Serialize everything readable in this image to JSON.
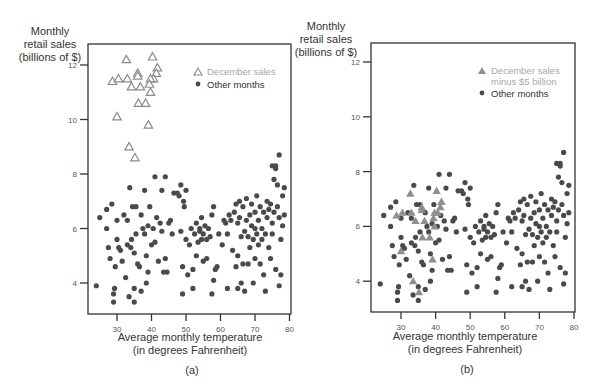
{
  "figure": {
    "panels": [
      {
        "label": "(a)",
        "y_title": [
          "Monthly",
          "retail sales",
          "(billions of $)"
        ],
        "x_title": [
          "Average monthly temperature",
          "(in degrees Fahrenheit)"
        ],
        "legend": [
          {
            "symbol": "open-triangle",
            "label": "December sales"
          },
          {
            "symbol": "dot",
            "label": "Other months"
          }
        ]
      },
      {
        "label": "(b)",
        "y_title": [
          "Monthly",
          "retail sales",
          "(billions of $)"
        ],
        "x_title": [
          "Average monthly temperature",
          "(in degrees Fahrenheit)"
        ],
        "legend": [
          {
            "symbol": "filled-triangle",
            "label": "December sales",
            "label2": "minus $5 billion"
          },
          {
            "symbol": "dot",
            "label": "Other months"
          }
        ]
      }
    ],
    "colors": {
      "dot": "#4a4a4a",
      "triangle_open": "#8a8a8a",
      "triangle_filled": "#8f8f8f",
      "legend_december": "#a8a8a8",
      "axis": "#333333"
    }
  },
  "chart_data": [
    {
      "type": "scatter",
      "title": "(a)",
      "xlabel": "Average monthly temperature (in degrees Fahrenheit)",
      "ylabel": "Monthly retail sales (billions of $)",
      "xlim": [
        22,
        80
      ],
      "ylim": [
        2.9,
        13.2
      ],
      "xticks": [
        30,
        40,
        50,
        60,
        70,
        80
      ],
      "yticks": [
        4,
        6,
        8,
        10,
        12
      ],
      "grid": false,
      "legend_position": "upper right",
      "series": [
        {
          "name": "December sales",
          "marker": "open-triangle",
          "points": [
            [
              32.7,
              12.2
            ],
            [
              40.3,
              12.3
            ],
            [
              36,
              11.7
            ],
            [
              36,
              11.6
            ],
            [
              41.7,
              11.9
            ],
            [
              41.4,
              11.7
            ],
            [
              40.6,
              11.5
            ],
            [
              28.7,
              11.4
            ],
            [
              30.4,
              11.5
            ],
            [
              33,
              11.5
            ],
            [
              34.2,
              11.2
            ],
            [
              36.8,
              11.2
            ],
            [
              39.7,
              11.5
            ],
            [
              39.4,
              11.3
            ],
            [
              39.7,
              11.0
            ],
            [
              36.2,
              10.6
            ],
            [
              38.3,
              10.6
            ],
            [
              30,
              10.1
            ],
            [
              39.1,
              9.8
            ],
            [
              33.5,
              9.0
            ],
            [
              35.2,
              8.6
            ]
          ]
        },
        {
          "name": "Other months",
          "marker": "dot",
          "ref": "other_months"
        }
      ]
    },
    {
      "type": "scatter",
      "title": "(b)",
      "xlabel": "Average monthly temperature (in degrees Fahrenheit)",
      "ylabel": "Monthly retail sales (billions of $)",
      "xlim": [
        22,
        80
      ],
      "ylim": [
        2.9,
        13.2
      ],
      "xticks": [
        30,
        40,
        50,
        60,
        70,
        80
      ],
      "yticks": [
        4,
        6,
        8,
        10,
        12
      ],
      "grid": false,
      "legend_position": "upper right",
      "series": [
        {
          "name": "December sales minus $5 billion",
          "marker": "filled-triangle",
          "points": [
            [
              32.7,
              7.2
            ],
            [
              40.3,
              7.3
            ],
            [
              36,
              6.7
            ],
            [
              36,
              6.6
            ],
            [
              41.7,
              6.9
            ],
            [
              41.4,
              6.7
            ],
            [
              40.6,
              6.5
            ],
            [
              28.7,
              6.4
            ],
            [
              30.4,
              6.5
            ],
            [
              33,
              6.5
            ],
            [
              34.2,
              6.2
            ],
            [
              36.8,
              6.2
            ],
            [
              39.7,
              6.5
            ],
            [
              39.4,
              6.3
            ],
            [
              39.7,
              6.0
            ],
            [
              36.2,
              5.6
            ],
            [
              38.3,
              5.6
            ],
            [
              30,
              5.1
            ],
            [
              39.1,
              4.8
            ],
            [
              33.5,
              4.0
            ],
            [
              35.2,
              3.6
            ]
          ]
        },
        {
          "name": "Other months",
          "marker": "dot",
          "ref": "other_months"
        }
      ]
    }
  ],
  "other_months": [
    [
      24,
      3.9
    ],
    [
      25,
      6.4
    ],
    [
      27,
      6.0
    ],
    [
      27,
      6.7
    ],
    [
      27.5,
      5.3
    ],
    [
      28,
      4.9
    ],
    [
      28.5,
      6.9
    ],
    [
      29,
      3.3
    ],
    [
      29,
      3.6
    ],
    [
      29.3,
      3.8
    ],
    [
      29.5,
      4.6
    ],
    [
      30,
      6.3
    ],
    [
      30,
      5.6
    ],
    [
      30.5,
      5.3
    ],
    [
      31,
      5.2
    ],
    [
      31.5,
      4.8
    ],
    [
      32,
      6.5
    ],
    [
      32.5,
      4.2
    ],
    [
      33,
      6.3
    ],
    [
      33,
      5.4
    ],
    [
      33.5,
      3.5
    ],
    [
      33.7,
      7.5
    ],
    [
      34,
      5.3
    ],
    [
      34.2,
      5.6
    ],
    [
      34.5,
      6.8
    ],
    [
      35,
      3.3
    ],
    [
      35,
      5.1
    ],
    [
      35,
      3.8
    ],
    [
      35.5,
      6.8
    ],
    [
      35.5,
      5.8
    ],
    [
      36,
      4.7
    ],
    [
      36.5,
      4.6
    ],
    [
      37,
      6.5
    ],
    [
      37,
      3.7
    ],
    [
      37.5,
      6.0
    ],
    [
      38,
      5.8
    ],
    [
      38,
      7.4
    ],
    [
      38.5,
      4.0
    ],
    [
      38.5,
      5.0
    ],
    [
      39,
      6.1
    ],
    [
      39,
      4.4
    ],
    [
      39.5,
      6.8
    ],
    [
      40,
      5.4
    ],
    [
      40.5,
      6.0
    ],
    [
      41,
      7.9
    ],
    [
      41,
      5.5
    ],
    [
      41.5,
      6.4
    ],
    [
      42,
      4.8
    ],
    [
      42.5,
      6.2
    ],
    [
      43,
      5.9
    ],
    [
      43,
      7.4
    ],
    [
      43.5,
      4.4
    ],
    [
      44,
      4.9
    ],
    [
      44,
      7.9
    ],
    [
      44.5,
      4.4
    ],
    [
      45,
      6.2
    ],
    [
      45.5,
      6.3
    ],
    [
      46,
      5.8
    ],
    [
      46.5,
      7.3
    ],
    [
      47.5,
      7.3
    ],
    [
      48,
      7.2
    ],
    [
      48.5,
      5.9
    ],
    [
      48.5,
      7.6
    ],
    [
      49,
      3.6
    ],
    [
      49,
      4.6
    ],
    [
      49.3,
      7.0
    ],
    [
      49.5,
      6.8
    ],
    [
      50,
      5.6
    ],
    [
      50,
      7.4
    ],
    [
      50.5,
      4.3
    ],
    [
      51,
      5.4
    ],
    [
      51.5,
      6.0
    ],
    [
      52,
      4.5
    ],
    [
      52,
      3.8
    ],
    [
      52.5,
      5.8
    ],
    [
      53,
      6.2
    ],
    [
      53,
      5.0
    ],
    [
      53.5,
      5.5
    ],
    [
      54,
      6.0
    ],
    [
      54,
      5.9
    ],
    [
      54.5,
      5.6
    ],
    [
      54.5,
      6.4
    ],
    [
      55,
      4.8
    ],
    [
      55,
      5.8
    ],
    [
      55.5,
      6.1
    ],
    [
      56,
      5.6
    ],
    [
      56,
      4.9
    ],
    [
      56.5,
      6.0
    ],
    [
      57,
      5.7
    ],
    [
      57.5,
      6.5
    ],
    [
      57.5,
      3.6
    ],
    [
      58,
      4.1
    ],
    [
      58,
      6.8
    ],
    [
      58.5,
      4.5
    ],
    [
      59,
      4.6
    ],
    [
      59.5,
      5.8
    ],
    [
      60.5,
      5.4
    ],
    [
      61,
      6.3
    ],
    [
      61.5,
      6.2
    ],
    [
      62,
      5.8
    ],
    [
      62,
      3.8
    ],
    [
      62.5,
      6.5
    ],
    [
      63,
      6.3
    ],
    [
      63.5,
      5.2
    ],
    [
      64,
      6.6
    ],
    [
      64.5,
      4.6
    ],
    [
      64.5,
      6.9
    ],
    [
      65,
      6.2
    ],
    [
      65,
      5.0
    ],
    [
      65,
      3.8
    ],
    [
      65.5,
      6.4
    ],
    [
      65.5,
      7.0
    ],
    [
      66,
      5.7
    ],
    [
      66,
      4.0
    ],
    [
      66.5,
      6.8
    ],
    [
      66.5,
      4.7
    ],
    [
      67,
      5.9
    ],
    [
      67,
      3.7
    ],
    [
      67.5,
      6.3
    ],
    [
      67.5,
      7.1
    ],
    [
      68,
      5.7
    ],
    [
      68,
      4.7
    ],
    [
      68.5,
      6.5
    ],
    [
      68.5,
      5.3
    ],
    [
      69,
      6.1
    ],
    [
      69,
      6.9
    ],
    [
      69.5,
      5.6
    ],
    [
      69.5,
      4.0
    ],
    [
      70,
      6.6
    ],
    [
      70,
      6.0
    ],
    [
      70,
      4.9
    ],
    [
      70.5,
      5.8
    ],
    [
      70.5,
      7.2
    ],
    [
      71,
      6.3
    ],
    [
      71,
      5.4
    ],
    [
      71.5,
      6.8
    ],
    [
      71.5,
      4.7
    ],
    [
      72,
      6.0
    ],
    [
      72,
      5.6
    ],
    [
      72.5,
      6.6
    ],
    [
      72.5,
      4.3
    ],
    [
      73,
      5.8
    ],
    [
      73,
      3.7
    ],
    [
      73.5,
      6.4
    ],
    [
      73.5,
      7.0
    ],
    [
      74,
      6.7
    ],
    [
      74,
      5.3
    ],
    [
      74.5,
      6.9
    ],
    [
      74.5,
      4.9
    ],
    [
      75,
      6.2
    ],
    [
      75,
      8.3
    ],
    [
      75,
      5.8
    ],
    [
      75.5,
      7.8
    ],
    [
      75.5,
      6.6
    ],
    [
      76,
      8.2
    ],
    [
      76,
      8.3
    ],
    [
      76,
      4.5
    ],
    [
      76.5,
      6.8
    ],
    [
      76.5,
      7.6
    ],
    [
      77,
      8.7
    ],
    [
      77,
      6.4
    ],
    [
      77,
      3.9
    ],
    [
      77.5,
      4.3
    ],
    [
      77.5,
      5.6
    ],
    [
      78,
      7.2
    ],
    [
      78,
      6.1
    ],
    [
      78.5,
      7.5
    ],
    [
      78.5,
      6.5
    ]
  ]
}
